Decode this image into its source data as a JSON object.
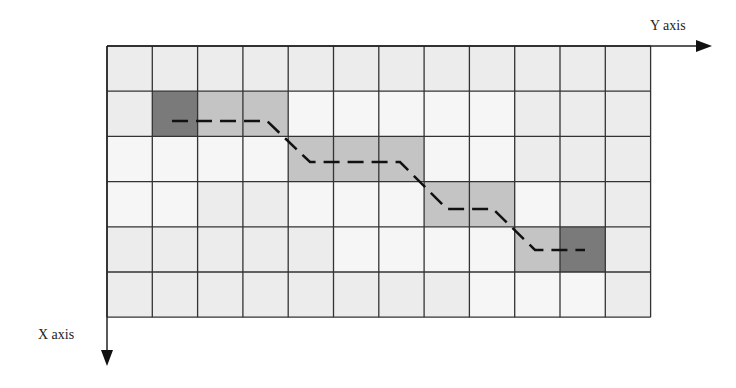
{
  "labels": {
    "y_axis": "Y axis",
    "x_axis": "X axis"
  },
  "grid": {
    "rows": 6,
    "cols": 12,
    "origin_x": 107,
    "origin_y": 46,
    "cell_w": 45.3,
    "cell_h": 45.2
  },
  "colors": {
    "background_cell": "#ececec",
    "light_cell": "#f6f6f6",
    "path_cell": "#c4c4c4",
    "endpoint_cell": "#7a7a7a",
    "grid_line": "#333333",
    "path_line": "#111111"
  },
  "light_cells": [
    [
      1,
      4
    ],
    [
      1,
      5
    ],
    [
      1,
      6
    ],
    [
      1,
      7
    ],
    [
      1,
      8
    ],
    [
      2,
      0
    ],
    [
      2,
      1
    ],
    [
      2,
      2
    ],
    [
      2,
      3
    ],
    [
      2,
      7
    ],
    [
      2,
      8
    ],
    [
      3,
      0
    ],
    [
      3,
      1
    ],
    [
      3,
      4
    ],
    [
      3,
      5
    ],
    [
      3,
      6
    ],
    [
      3,
      9
    ],
    [
      4,
      5
    ],
    [
      4,
      6
    ],
    [
      4,
      7
    ],
    [
      4,
      8
    ],
    [
      5,
      8
    ],
    [
      5,
      9
    ],
    [
      5,
      10
    ]
  ],
  "path_cells": [
    {
      "row": 1,
      "col": 1,
      "type": "endpoint"
    },
    {
      "row": 1,
      "col": 2,
      "type": "path"
    },
    {
      "row": 1,
      "col": 3,
      "type": "path"
    },
    {
      "row": 2,
      "col": 4,
      "type": "path"
    },
    {
      "row": 2,
      "col": 5,
      "type": "path"
    },
    {
      "row": 2,
      "col": 6,
      "type": "path"
    },
    {
      "row": 3,
      "col": 7,
      "type": "path"
    },
    {
      "row": 3,
      "col": 8,
      "type": "path"
    },
    {
      "row": 4,
      "col": 9,
      "type": "path"
    },
    {
      "row": 4,
      "col": 10,
      "type": "endpoint"
    }
  ],
  "path_points": [
    [
      172,
      121
    ],
    [
      267,
      121
    ],
    [
      310,
      162
    ],
    [
      400,
      162
    ],
    [
      447,
      209
    ],
    [
      493,
      209
    ],
    [
      535,
      250
    ],
    [
      585,
      250
    ]
  ]
}
